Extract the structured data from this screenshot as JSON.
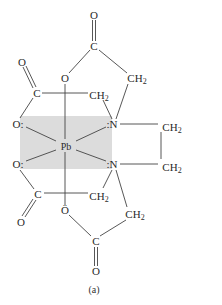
{
  "figure": {
    "caption": "(a)",
    "highlight_color": "#dcdcdc",
    "metal": "Pb",
    "atoms": {
      "o_top": "O",
      "c_top": "C",
      "o_upper_mid": "O",
      "ch2_upper_right": "CH",
      "o_upper_left": "O",
      "c_upper_left": "C",
      "ch2_upper_mid": "CH",
      "o_left_upper": "O:",
      "n_upper": ":N",
      "ch2_far_right_upper": "CH",
      "pb": "Pb",
      "o_left_lower": "O:",
      "n_lower": ":N",
      "ch2_far_right_lower": "CH",
      "c_lower_left": "C",
      "ch2_lower_mid": "CH",
      "o_lower_mid": "Ö",
      "o_lower_left": "O",
      "ch2_lower_right": "CH",
      "c_bottom": "C",
      "o_bottom": "O"
    },
    "subscript": "2"
  }
}
